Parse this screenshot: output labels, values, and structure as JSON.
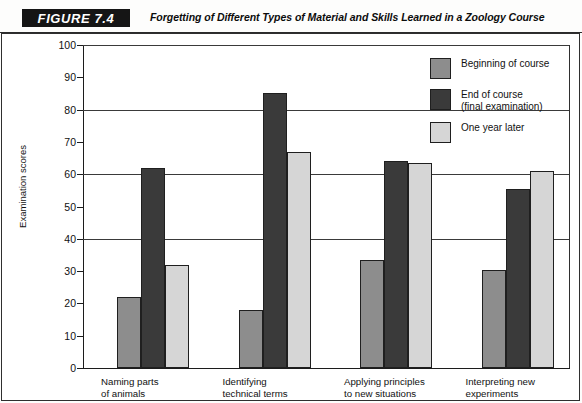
{
  "figure": {
    "badge": "FIGURE 7.4",
    "title": "Forgetting of Different Types of Material and Skills Learned in a Zoology Course"
  },
  "legend": {
    "position": "top-right",
    "items": [
      {
        "label": "Beginning of course",
        "color": "#8d8d8d"
      },
      {
        "label": "End of course\n(final examination)",
        "color": "#3a3a3a"
      },
      {
        "label": "One year later",
        "color": "#d6d6d6"
      }
    ]
  },
  "axis": {
    "y_label": "Examination\nscores",
    "y_ticks": [
      "0",
      "10",
      "20",
      "30",
      "40",
      "50",
      "60",
      "70",
      "80",
      "90",
      "100"
    ],
    "gridline_values": [
      40,
      60,
      80,
      100
    ]
  },
  "chart_data": {
    "type": "bar",
    "title": "Forgetting of Different Types of Material and Skills Learned in a Zoology Course",
    "xlabel": "",
    "ylabel": "Examination scores",
    "ylim": [
      0,
      100
    ],
    "ytick_step": 10,
    "grid": true,
    "grid_values": [
      40,
      60,
      80,
      100
    ],
    "legend_position": "top-right",
    "categories": [
      "Naming parts\nof animals",
      "Identifying\ntechnical terms",
      "Applying principles\nto new situations",
      "Interpreting new\nexperiments"
    ],
    "series": [
      {
        "name": "Beginning of course",
        "color": "#8d8d8d",
        "values": [
          22,
          18,
          33.5,
          30.5
        ]
      },
      {
        "name": "End of course (final examination)",
        "color": "#3a3a3a",
        "values": [
          62,
          85,
          64,
          55.5
        ]
      },
      {
        "name": "One year later",
        "color": "#d6d6d6",
        "values": [
          32,
          67,
          63.5,
          61
        ]
      }
    ]
  }
}
